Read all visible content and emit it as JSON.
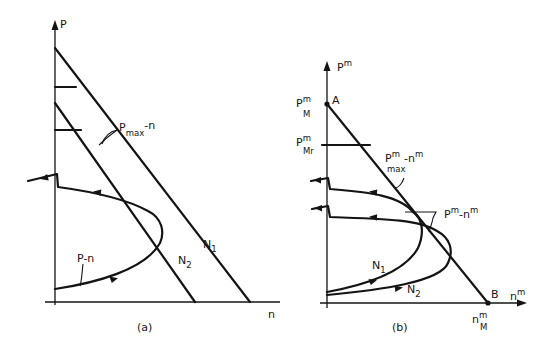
{
  "figure": {
    "panel_a": {
      "caption": "(a)",
      "y_axis_label": "P",
      "x_axis_label": "n",
      "curve_label": "P-n",
      "line_label_base": "P",
      "line_label_sub": "max",
      "line_label_suffix": "-n",
      "line_labels": [
        {
          "base": "N",
          "sub": "1"
        },
        {
          "base": "N",
          "sub": "2"
        }
      ]
    },
    "panel_b": {
      "caption": "(b)",
      "y_axis_label_base": "P",
      "y_axis_label_sup": "m",
      "x_axis_label_base": "n",
      "x_axis_label_sup": "m",
      "point_a": "A",
      "point_b": "B",
      "pm_label": {
        "base": "P",
        "sup": "m",
        "sub": "M"
      },
      "pmr_label": {
        "base": "P",
        "sup": "m",
        "sub": "Mr"
      },
      "nm_label": {
        "base": "n",
        "sup": "m",
        "sub": "M"
      },
      "line_label": {
        "base": "P",
        "sup": "m",
        "sub": "max",
        "suffix": "-n",
        "suffix_sup": "m"
      },
      "curve_label": {
        "base": "P",
        "sup": "m",
        "mid": "-n",
        "mid_sup": "m"
      },
      "curve_labels": [
        {
          "base": "N",
          "sub": "1"
        },
        {
          "base": "N",
          "sub": "2"
        }
      ]
    }
  }
}
